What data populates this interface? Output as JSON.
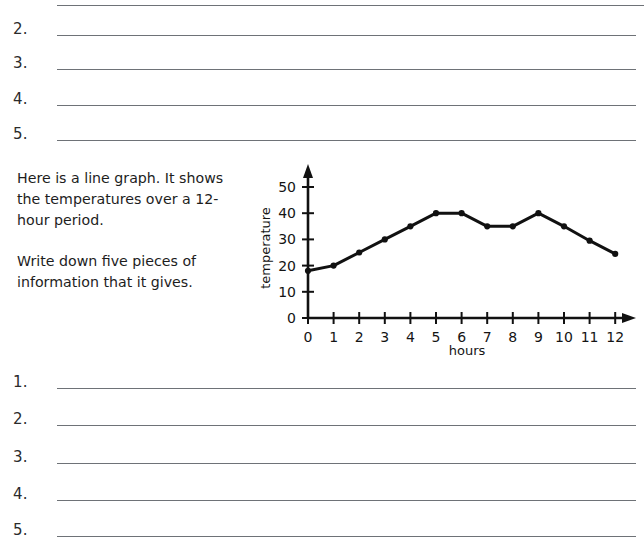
{
  "worksheet": {
    "top_answers": {
      "partial_line_above": true,
      "items": [
        {
          "number": "2."
        },
        {
          "number": "3."
        },
        {
          "number": "4."
        },
        {
          "number": "5."
        }
      ]
    },
    "question": {
      "paragraph_1": "Here is a line graph. It shows the temperatures over a 12-hour period.",
      "paragraph_2": "Write down five pieces of information that it gives."
    },
    "bottom_answers": {
      "items": [
        {
          "number": "1."
        },
        {
          "number": "2."
        },
        {
          "number": "3."
        },
        {
          "number": "4."
        },
        {
          "number": "5."
        }
      ]
    }
  },
  "chart_data": {
    "type": "line",
    "title": "",
    "xlabel": "hours",
    "ylabel": "temperature",
    "x": [
      0,
      1,
      2,
      3,
      4,
      5,
      6,
      7,
      8,
      9,
      10,
      11,
      12
    ],
    "values": [
      18,
      20,
      25,
      30,
      35,
      40,
      40,
      35,
      35,
      40,
      35,
      29.5,
      24.5
    ],
    "xticks": [
      "0",
      "1",
      "2",
      "3",
      "4",
      "5",
      "6",
      "7",
      "8",
      "9",
      "10",
      "11",
      "12"
    ],
    "yticks": [
      "0",
      "10",
      "20",
      "30",
      "40",
      "50"
    ],
    "ytick_values": [
      0,
      10,
      20,
      30,
      40,
      50
    ],
    "xlim": [
      0,
      12
    ],
    "ylim": [
      0,
      55
    ],
    "grid": false,
    "legend": false,
    "marker": "filled-circle",
    "line_color": "#111111",
    "marker_color": "#111111",
    "axis_color": "#111111"
  },
  "colors": {
    "page_background": "#ffffff",
    "rule_line": "#6e7277",
    "text": "#1d1d1d",
    "chart_ink": "#111111"
  }
}
